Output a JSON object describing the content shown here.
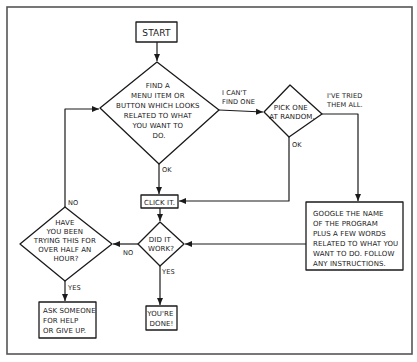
{
  "diagram": {
    "colors": {
      "ink": "#1a1a1a",
      "frame": "#555555",
      "background": "#ffffff"
    },
    "nodes": {
      "start": {
        "type": "box",
        "lines": [
          "START"
        ]
      },
      "find_item": {
        "type": "decision",
        "lines": [
          "FIND A",
          "MENU ITEM OR",
          "BUTTON WHICH LOOKS",
          "RELATED TO WHAT",
          "YOU WANT TO",
          "DO."
        ]
      },
      "pick_random": {
        "type": "decision",
        "lines": [
          "PICK ONE",
          "AT RANDOM."
        ]
      },
      "google": {
        "type": "box",
        "lines": [
          "GOOGLE THE NAME",
          "OF THE PROGRAM",
          "PLUS A FEW WORDS",
          "RELATED TO WHAT YOU",
          "WANT TO DO. FOLLOW",
          "ANY INSTRUCTIONS."
        ]
      },
      "click_it": {
        "type": "box",
        "lines": [
          "CLICK IT."
        ]
      },
      "did_it_work": {
        "type": "decision",
        "lines": [
          "DID IT",
          "WORK?"
        ]
      },
      "half_hour": {
        "type": "decision",
        "lines": [
          "HAVE",
          "YOU BEEN",
          "TRYING THIS FOR",
          "OVER HALF AN",
          "HOUR?"
        ]
      },
      "ask_someone": {
        "type": "box",
        "lines": [
          "ASK SOMEONE",
          "FOR HELP",
          "OR GIVE UP."
        ]
      },
      "done": {
        "type": "box",
        "lines": [
          "YOU'RE",
          "DONE!"
        ]
      }
    },
    "edges": {
      "cant_find": {
        "lines": [
          "I CAN'T",
          "FIND ONE"
        ]
      },
      "tried_all": {
        "lines": [
          "I'VE TRIED",
          "THEM ALL."
        ]
      },
      "find_ok": {
        "label": "OK"
      },
      "pick_ok": {
        "label": "OK"
      },
      "work_no": {
        "label": "NO"
      },
      "work_yes": {
        "label": "YES"
      },
      "half_no": {
        "label": "NO"
      },
      "half_yes": {
        "label": "YES"
      }
    }
  }
}
